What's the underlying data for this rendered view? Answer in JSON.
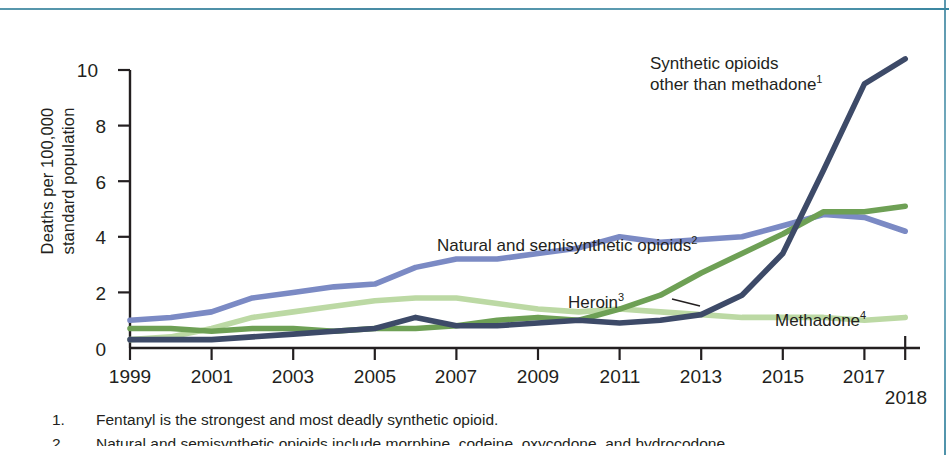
{
  "figure": {
    "y_axis_label": "Deaths per 100,000\nstandard population",
    "y_ticks": [
      "0",
      "2",
      "4",
      "6",
      "8",
      "10"
    ],
    "x_ticks": [
      "1999",
      "2001",
      "2003",
      "2005",
      "2007",
      "2009",
      "2011",
      "2013",
      "2015",
      "2017"
    ],
    "x_tick_last": "2018"
  },
  "annotations": {
    "synthetic": "Synthetic opioids\nother than methadone",
    "synthetic_sup": "1",
    "natural": "Natural and semisynthetic opioids",
    "natural_sup": "2",
    "heroin": "Heroin",
    "heroin_sup": "3",
    "methadone": "Methadone",
    "methadone_sup": "4"
  },
  "footnotes": [
    {
      "num": "1.",
      "text": "Fentanyl is the strongest and most deadly synthetic opioid."
    },
    {
      "num": "2.",
      "text": "Natural and semisynthetic opioids include morphine, codeine, oxycodone, and hydrocodone."
    }
  ],
  "colors": {
    "synthetic": "#3d4a68",
    "natural": "#7b8ac4",
    "heroin": "#6ea055",
    "methadone": "#bcd9a4",
    "axis": "#231f20",
    "rule": "#3f86a0",
    "text": "#231f20"
  },
  "chart_data": {
    "type": "line",
    "title": "",
    "xlabel": "",
    "ylabel": "Deaths per 100,000 standard population",
    "xlim": [
      1999,
      2018
    ],
    "ylim": [
      0,
      10.8
    ],
    "yticks": [
      0,
      2,
      4,
      6,
      8,
      10
    ],
    "xticks": [
      1999,
      2001,
      2003,
      2005,
      2007,
      2009,
      2011,
      2013,
      2015,
      2017,
      2018
    ],
    "grid": false,
    "legend": "inline-annotations",
    "x": [
      1999,
      2000,
      2001,
      2002,
      2003,
      2004,
      2005,
      2006,
      2007,
      2008,
      2009,
      2010,
      2011,
      2012,
      2013,
      2014,
      2015,
      2016,
      2017,
      2018
    ],
    "series": [
      {
        "name": "Synthetic opioids other than methadone",
        "color": "#3d4a68",
        "values": [
          0.3,
          0.3,
          0.3,
          0.4,
          0.5,
          0.6,
          0.7,
          1.1,
          0.8,
          0.8,
          0.9,
          1.0,
          0.9,
          1.0,
          1.2,
          1.9,
          3.4,
          6.4,
          9.5,
          10.4
        ]
      },
      {
        "name": "Natural and semisynthetic opioids",
        "color": "#7b8ac4",
        "values": [
          1.0,
          1.1,
          1.3,
          1.8,
          2.0,
          2.2,
          2.3,
          2.9,
          3.2,
          3.2,
          3.4,
          3.6,
          4.0,
          3.8,
          3.9,
          4.0,
          4.4,
          4.8,
          4.7,
          4.2
        ]
      },
      {
        "name": "Heroin",
        "color": "#6ea055",
        "values": [
          0.7,
          0.7,
          0.6,
          0.7,
          0.7,
          0.6,
          0.7,
          0.7,
          0.8,
          1.0,
          1.1,
          1.0,
          1.4,
          1.9,
          2.7,
          3.4,
          4.1,
          4.9,
          4.9,
          5.1
        ]
      },
      {
        "name": "Methadone",
        "color": "#bcd9a4",
        "values": [
          0.3,
          0.4,
          0.7,
          1.1,
          1.3,
          1.5,
          1.7,
          1.8,
          1.8,
          1.6,
          1.4,
          1.3,
          1.4,
          1.3,
          1.2,
          1.1,
          1.1,
          1.1,
          1.0,
          1.1
        ]
      }
    ]
  }
}
